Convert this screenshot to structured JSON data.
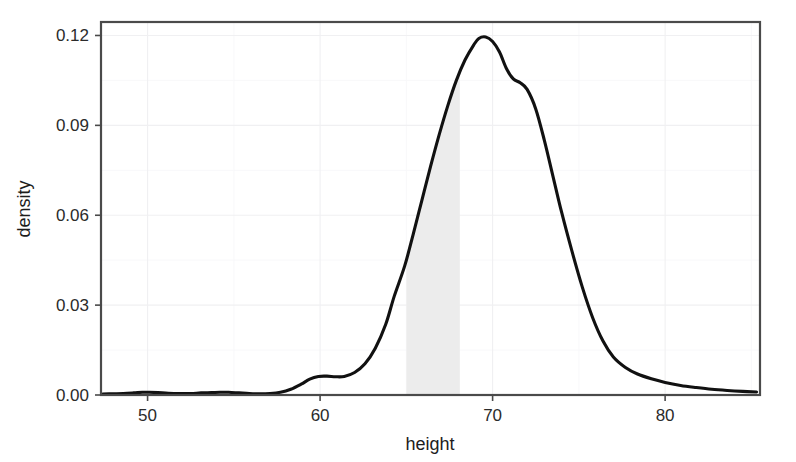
{
  "chart_data": {
    "type": "area",
    "title": "",
    "subtitle": "",
    "xlabel": "height",
    "ylabel": "density",
    "xlim": [
      47.3,
      85.5
    ],
    "ylim": [
      0.0,
      0.1245
    ],
    "x_ticks": [
      50,
      60,
      70,
      80
    ],
    "x_tick_labels": [
      "50",
      "60",
      "70",
      "80"
    ],
    "y_ticks": [
      0.0,
      0.03,
      0.06,
      0.09,
      0.12
    ],
    "y_tick_labels": [
      "0.00",
      "0.03",
      "0.06",
      "0.09",
      "0.12"
    ],
    "grid": true,
    "grid_color": "#f0f0f2",
    "legend": "none",
    "line_color": "#111111",
    "shade_color": "#ebebeb",
    "panel_background": "#ffffff",
    "panel_border_color": "#4a4a4a",
    "annotations": [
      {
        "kind": "shaded_interval",
        "x_start": 65.0,
        "x_end": 68.1,
        "description": "shaded region under density curve between height 65 and 68"
      }
    ],
    "series": [
      {
        "name": "density",
        "x": [
          47.4,
          48.0,
          48.6,
          49.2,
          49.7,
          50.1,
          50.6,
          51.2,
          51.9,
          52.5,
          53.1,
          53.7,
          54.2,
          54.7,
          55.3,
          55.9,
          56.5,
          57.1,
          57.7,
          58.3,
          58.9,
          59.4,
          59.9,
          60.4,
          60.9,
          61.4,
          62.0,
          62.6,
          63.2,
          63.8,
          64.3,
          64.9,
          65.4,
          65.9,
          66.4,
          66.9,
          67.4,
          67.9,
          68.4,
          68.9,
          69.2,
          69.6,
          70.0,
          70.4,
          70.8,
          71.2,
          71.6,
          72.0,
          72.5,
          73.0,
          73.5,
          74.0,
          74.6,
          75.2,
          75.8,
          76.4,
          77.0,
          77.7,
          78.4,
          79.2,
          80.0,
          80.9,
          81.8,
          82.7,
          83.6,
          84.5,
          85.3
        ],
        "y": [
          0.0003,
          0.0004,
          0.0005,
          0.0007,
          0.0009,
          0.0009,
          0.0008,
          0.0006,
          0.0005,
          0.0005,
          0.0007,
          0.0008,
          0.0009,
          0.0009,
          0.0007,
          0.0005,
          0.0004,
          0.0005,
          0.0009,
          0.0019,
          0.0036,
          0.0053,
          0.0062,
          0.0063,
          0.0061,
          0.0062,
          0.0075,
          0.0104,
          0.0156,
          0.0235,
          0.033,
          0.043,
          0.0537,
          0.065,
          0.0762,
          0.0868,
          0.0965,
          0.105,
          0.1118,
          0.1168,
          0.119,
          0.1195,
          0.118,
          0.1145,
          0.109,
          0.1055,
          0.1042,
          0.102,
          0.0955,
          0.085,
          0.073,
          0.061,
          0.048,
          0.036,
          0.0258,
          0.018,
          0.0127,
          0.0092,
          0.007,
          0.0054,
          0.0042,
          0.0032,
          0.0025,
          0.0019,
          0.0015,
          0.0012,
          0.001
        ]
      }
    ]
  },
  "axes": {
    "x_axis_title": "height",
    "y_axis_title": "density"
  }
}
